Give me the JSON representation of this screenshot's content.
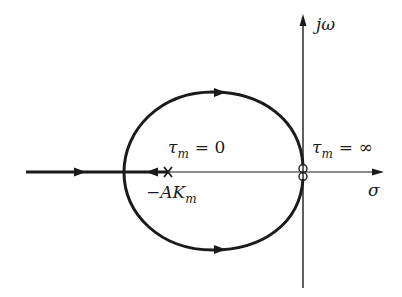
{
  "diagram": {
    "type": "root-locus",
    "axes": {
      "real_axis_label": "σ",
      "imag_axis_label": "jω"
    },
    "labels": {
      "tau_zero": {
        "symbol": "τ",
        "subscript": "m",
        "value": "= 0"
      },
      "tau_inf": {
        "symbol": "τ",
        "subscript": "m",
        "value": "= ∞"
      },
      "pole": {
        "prefix": "−AK",
        "subscript": "m"
      }
    },
    "markers": {
      "pole_marker": "×",
      "zero_markers": "double-zero at origin"
    },
    "colors": {
      "stroke": "#1a1a1a"
    }
  }
}
